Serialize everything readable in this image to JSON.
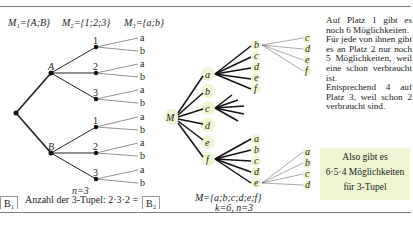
{
  "b1": {
    "sets": {
      "m1": "M₁={A;B}",
      "m2": "M₂={1;2;3}",
      "m3": "M₃={a;b}"
    },
    "level1": [
      "A",
      "B"
    ],
    "level2": [
      "1",
      "2",
      "3"
    ],
    "level3": [
      "a",
      "b"
    ],
    "n_label": "n=3",
    "count_label": "Anzahl der 3-Tupel: 2·3·2 = 12",
    "panel_label": "B₁"
  },
  "b2": {
    "root": "M",
    "level1": [
      "a",
      "b",
      "c",
      "d",
      "e",
      "f"
    ],
    "branch_a": [
      "b",
      "c",
      "d",
      "e",
      "f"
    ],
    "branch_ab": [
      "c",
      "d",
      "e",
      "f"
    ],
    "branch_f": [
      "a",
      "b",
      "c",
      "d",
      "e"
    ],
    "branch_fe": [
      "a",
      "b",
      "c",
      "d"
    ],
    "set_label": "M={a;b;c;d;e;f}",
    "params_label": "k=6, n=3",
    "panel_label": "B₂"
  },
  "explanation": {
    "p1": "Auf Platz 1 gibt es noch 6 Möglichkeiten.",
    "p2": "Für jede von ihnen gibt es an Platz 2 nur noch 5 Möglichkeiten, weil eine schon verbraucht ist.",
    "p3": "Entsprechend 4 auf Platz 3, weil schon 2 verbraucht sind."
  },
  "conclusion": {
    "line1": "Also gibt es",
    "line2": "6·5·4 Möglichkeiten",
    "line3": "für 3-Tupel"
  },
  "colors": {
    "highlight": "#eef5d0",
    "frame": "#777777"
  }
}
